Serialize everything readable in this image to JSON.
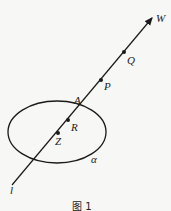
{
  "diagram": {
    "caption": "图 1",
    "line": {
      "label": "l",
      "arrow_label": "W"
    },
    "plane": {
      "label": "α"
    },
    "points": {
      "Q": "Q",
      "P": "P",
      "A": "A",
      "R": "R",
      "Z": "Z"
    },
    "colors": {
      "stroke": "#1a1a1a",
      "background": "#f7f7f5"
    }
  }
}
